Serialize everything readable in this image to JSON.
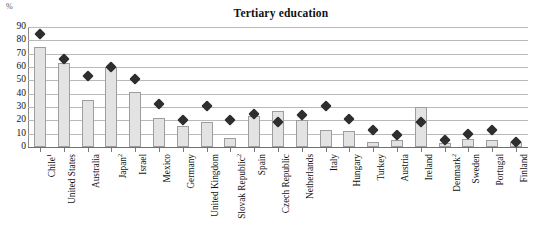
{
  "chart_data": {
    "type": "bar",
    "title": "Tertiary education",
    "xlabel": "",
    "ylabel": "%",
    "ylim": [
      0,
      90
    ],
    "yticks": [
      0,
      10,
      20,
      30,
      40,
      50,
      60,
      70,
      80,
      90
    ],
    "grid": true,
    "legend": "none",
    "categories": [
      "Chile",
      "United States",
      "Australia",
      "Japan",
      "Israel",
      "Mexico",
      "Germany",
      "United Kingdom",
      "Slovak Republic",
      "Spain",
      "Czech Republic",
      "Netherlands",
      "Italy",
      "Hungary",
      "Turkey",
      "Austria",
      "Ireland",
      "Denmark",
      "Sweden",
      "Portugal",
      "Finland"
    ],
    "category_footnotes": [
      "1",
      "",
      "",
      "2",
      "",
      "",
      "",
      "",
      "2",
      "",
      "",
      "",
      "",
      "",
      "",
      "",
      "",
      "2",
      "",
      "",
      ""
    ],
    "series": [
      {
        "name": "bars",
        "type": "bar",
        "values": [
          75,
          63,
          35,
          60,
          41,
          22,
          16,
          19,
          7,
          23,
          27,
          20,
          13,
          12,
          4,
          5,
          30,
          3,
          6,
          5,
          4
        ]
      },
      {
        "name": "markers",
        "type": "scatter",
        "values": [
          85,
          66,
          53,
          60,
          51,
          32,
          20,
          31,
          20,
          25,
          19,
          24,
          31,
          21,
          13,
          9,
          19,
          5,
          10,
          13,
          4
        ]
      }
    ],
    "colors": {
      "bar_fill": "#e3e3e3",
      "bar_border": "#9d9d9d",
      "marker": "#2e2e2e",
      "gridline": "#b9b9b9",
      "axis": "#6f6f6f",
      "text": "#111111"
    }
  }
}
